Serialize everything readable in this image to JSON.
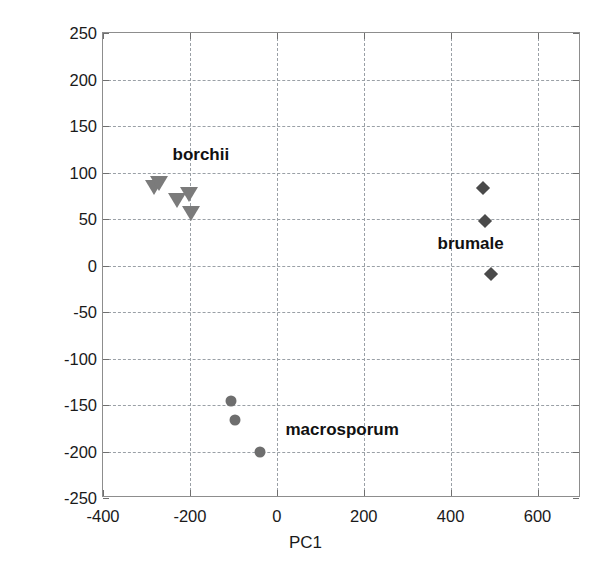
{
  "chart_data": {
    "type": "scatter",
    "title": "",
    "xlabel": "PC1",
    "ylabel": "PC2",
    "xlim": [
      -400,
      700
    ],
    "ylim": [
      -250,
      250
    ],
    "xticks": [
      -400,
      -200,
      0,
      200,
      400,
      600
    ],
    "xtick_labels": [
      "-400",
      "-200",
      "0",
      "200",
      "400",
      "600"
    ],
    "yticks": [
      -250,
      -200,
      -150,
      -100,
      -50,
      0,
      50,
      100,
      150,
      200,
      250
    ],
    "ytick_labels": [
      "250",
      "200",
      "150",
      "100",
      "50",
      "0",
      "-50",
      "-100",
      "-150",
      "-200",
      "-250"
    ],
    "grid": true,
    "grid_style": "dashed",
    "legend": "none",
    "annotations": [
      {
        "text": "borchii",
        "x": -240,
        "y": 118
      },
      {
        "text": "brumale",
        "x": 370,
        "y": 22
      },
      {
        "text": "macrosporum",
        "x": 20,
        "y": -178
      }
    ],
    "series": [
      {
        "name": "borchii",
        "marker": "triangle-down",
        "color": "#7b7b7b",
        "points": [
          {
            "x": -283,
            "y": 86
          },
          {
            "x": -270,
            "y": 90
          },
          {
            "x": -230,
            "y": 71
          },
          {
            "x": -203,
            "y": 78
          },
          {
            "x": -198,
            "y": 57
          }
        ]
      },
      {
        "name": "brumale",
        "marker": "diamond",
        "color": "#4a4a4a",
        "points": [
          {
            "x": 475,
            "y": 83
          },
          {
            "x": 478,
            "y": 48
          },
          {
            "x": 492,
            "y": -9
          }
        ]
      },
      {
        "name": "macrosporum",
        "marker": "circle",
        "color": "#6e6e6e",
        "points": [
          {
            "x": -106,
            "y": -146
          },
          {
            "x": -96,
            "y": -166
          },
          {
            "x": -39,
            "y": -201
          }
        ]
      }
    ]
  }
}
